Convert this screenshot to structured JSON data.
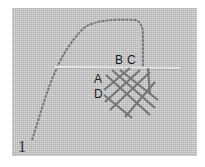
{
  "figure": {
    "step_number": "1",
    "labels": {
      "a": "A",
      "b": "B",
      "c": "C",
      "d": "D"
    },
    "colors": {
      "fabric": "#c8c8c8",
      "thread": "#7a7a7a",
      "guide_line": "#e8e8e8",
      "stitches": "#6e6e6e"
    }
  }
}
